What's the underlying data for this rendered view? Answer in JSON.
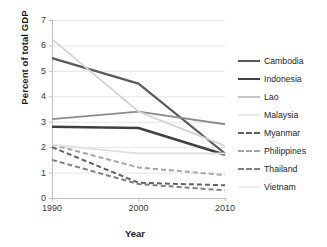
{
  "chart_data": {
    "type": "line",
    "title": "",
    "xlabel": "Year",
    "ylabel": "Percent of total GDP",
    "x": [
      1990,
      2000,
      2010
    ],
    "xtick_labels": [
      "1990",
      "2000",
      "2010"
    ],
    "ytick_labels": [
      "0",
      "1",
      "2",
      "3",
      "4",
      "5",
      "6",
      "7"
    ],
    "ylim": [
      0,
      7
    ],
    "xlim": [
      1990,
      2010
    ],
    "grid": "horizontal",
    "legend_position": "right",
    "series": [
      {
        "name": "Cambodia",
        "values": [
          5.5,
          4.5,
          1.75
        ],
        "color": "#595959",
        "style": "solid",
        "width": 2.2
      },
      {
        "name": "Indonesia",
        "values": [
          2.8,
          2.75,
          1.7
        ],
        "color": "#404040",
        "style": "solid",
        "width": 2.6
      },
      {
        "name": "Lao",
        "values": [
          3.1,
          3.4,
          2.9
        ],
        "color": "#8c8c8c",
        "style": "solid",
        "width": 1.8
      },
      {
        "name": "Malaysia",
        "values": [
          6.25,
          3.4,
          2.05
        ],
        "color": "#d4d4d4",
        "style": "solid",
        "width": 1.8
      },
      {
        "name": "Myanmar",
        "values": [
          2.0,
          0.6,
          0.5
        ],
        "color": "#636363",
        "style": "dashed",
        "width": 2.0
      },
      {
        "name": "Philippines",
        "values": [
          2.1,
          1.2,
          0.9
        ],
        "color": "#a6a6a6",
        "style": "dashed",
        "width": 2.0
      },
      {
        "name": "Thailand",
        "values": [
          1.5,
          0.55,
          0.3
        ],
        "color": "#808080",
        "style": "dashed",
        "width": 2.0
      },
      {
        "name": "Vietnam",
        "values": [
          2.1,
          1.75,
          1.75
        ],
        "color": "#e0e0e0",
        "style": "solid",
        "width": 1.8
      }
    ]
  },
  "axes": {
    "y_title": "Percent of total GDP",
    "x_title": "Year",
    "y_ticks": [
      "7",
      "6",
      "5",
      "4",
      "3",
      "2",
      "1",
      "0"
    ],
    "x_ticks": [
      "1990",
      "2000",
      "2010"
    ]
  },
  "legend": {
    "items": [
      {
        "label": "Cambodia"
      },
      {
        "label": "Indonesia"
      },
      {
        "label": "Lao"
      },
      {
        "label": "Malaysia"
      },
      {
        "label": "Myanmar"
      },
      {
        "label": "Philippines"
      },
      {
        "label": "Thailand"
      },
      {
        "label": "Vietnam"
      }
    ]
  },
  "colors": {
    "grid": "#e6e6e6",
    "axis": "#bfbfbf",
    "text": "#3b3b3b"
  }
}
